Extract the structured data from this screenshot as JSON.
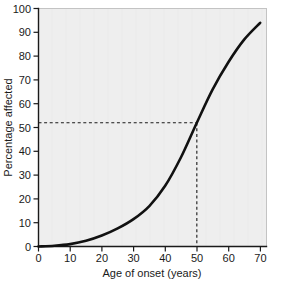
{
  "chart_data": {
    "type": "line",
    "title": "",
    "xlabel": "Age of onset (years)",
    "ylabel": "Percentage affected",
    "xlim": [
      0,
      72
    ],
    "ylim": [
      0,
      100
    ],
    "xticks": [
      0,
      10,
      20,
      30,
      40,
      50,
      60,
      70
    ],
    "xtick_labels": [
      "0",
      "10",
      "20",
      "30",
      "40",
      "50",
      "60",
      "70"
    ],
    "yticks": [
      0,
      10,
      20,
      30,
      40,
      50,
      60,
      70,
      80,
      90,
      100
    ],
    "ytick_labels": [
      "0",
      "10",
      "20",
      "30",
      "40",
      "50",
      "60",
      "70",
      "80",
      "90",
      "100"
    ],
    "grid": false,
    "legend": "none",
    "series": [
      {
        "name": "Cumulative percentage affected",
        "x": [
          0,
          5,
          10,
          15,
          20,
          25,
          30,
          35,
          40,
          45,
          50,
          55,
          60,
          65,
          70
        ],
        "values": [
          0,
          0.3,
          1.0,
          2.4,
          4.6,
          7.6,
          11.5,
          17.0,
          25.5,
          37.5,
          52.0,
          66.0,
          77.5,
          87.0,
          94.0
        ],
        "color": "#111111"
      }
    ],
    "annotations": [
      {
        "name": "reference-lines",
        "kind": "crosshair-dashed",
        "x": 50,
        "y": 52,
        "style": "dashed",
        "color": "#1a1a1a",
        "description": "Dashed horizontal line from y-axis at 52 percent meeting dashed vertical line down to x-axis at age 50"
      }
    ],
    "plot_background": "#eeeeee",
    "axis_color": "#1a1a1a"
  },
  "axes": {
    "x_title": "Age of onset (years)",
    "y_title": "Percentage affected"
  }
}
